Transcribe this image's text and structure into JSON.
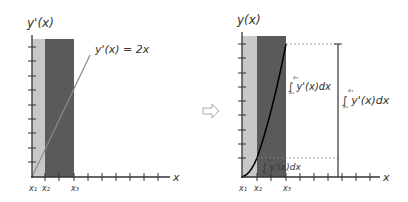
{
  "left_panel": {
    "y_axis_label": "y'(x)",
    "equation_label": "y'(x) = 2x",
    "x_axis_label": "x",
    "tick_labels": [
      "x₁",
      "x₂",
      "x₃"
    ]
  },
  "arrow": {
    "icon": "right-arrow-outline"
  },
  "right_panel": {
    "y_axis_label": "y(x)",
    "x_axis_label": "x",
    "tick_labels": [
      "x₁",
      "x₂",
      "x₃"
    ],
    "upper_integral_label": "∫ y'(x)dx",
    "upper_integral_limits": {
      "lower": "x₂",
      "upper": "x₃"
    },
    "lower_integral_label": "∫ y'(x)dx",
    "lower_integral_limits": {
      "lower": "x₁",
      "upper": "x₂"
    },
    "total_integral_label": "∫ y'(x)dx",
    "total_integral_limits": {
      "lower": "x₁",
      "upper": "x₃"
    }
  },
  "colors": {
    "light_band": "#c8c8c8",
    "dark_band": "#5a5a5a",
    "axis": "#333333",
    "line": "#8a8a8a",
    "curve": "#000000"
  }
}
